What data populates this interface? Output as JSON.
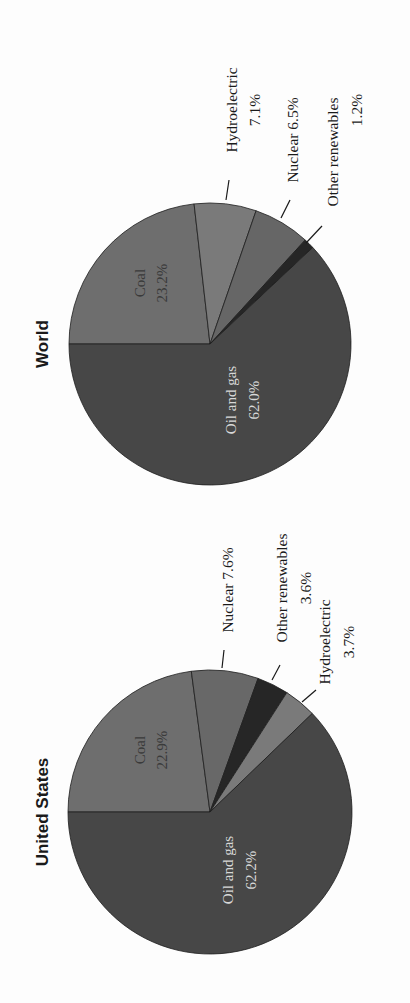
{
  "chart_data": [
    {
      "type": "pie",
      "title": "World",
      "orientation": "rotated 90° counterclockwise",
      "labels": [
        "Coal",
        "Hydroelectric",
        "Nuclear",
        "Other renewables",
        "Oil and gas"
      ],
      "values": [
        23.2,
        7.1,
        6.5,
        1.2,
        62.0
      ],
      "value_labels": [
        "23.2%",
        "7.1%",
        "6.5%",
        "1.2%",
        "62.0%"
      ],
      "colors": [
        "#6e6e6e",
        "#7a7a7a",
        "#666666",
        "#262626",
        "#474747"
      ]
    },
    {
      "type": "pie",
      "title": "United States",
      "orientation": "rotated 90° counterclockwise",
      "labels": [
        "Coal",
        "Nuclear",
        "Other renewables",
        "Hydroelectric",
        "Oil and gas"
      ],
      "values": [
        22.9,
        7.6,
        3.6,
        3.7,
        62.2
      ],
      "value_labels": [
        "22.9%",
        "7.6%",
        "3.6%",
        "3.7%",
        "62.2%"
      ],
      "colors": [
        "#6e6e6e",
        "#686868",
        "#262626",
        "#7a7a7a",
        "#474747"
      ]
    }
  ],
  "charts": {
    "world": {
      "title": "World",
      "inner": {
        "coal_name": "Coal",
        "coal_value": "23.2%",
        "oil_name": "Oil and gas",
        "oil_value": "62.0%"
      },
      "external": {
        "hydro_name": "Hydroelectric",
        "hydro_value": "7.1%",
        "nuclear": "Nuclear 6.5%",
        "other_name": "Other renewables",
        "other_value": "1.2%"
      }
    },
    "us": {
      "title": "United States",
      "inner": {
        "coal_name": "Coal",
        "coal_value": "22.9%",
        "oil_name": "Oil and gas",
        "oil_value": "62.2%"
      },
      "external": {
        "nuclear": "Nuclear 7.6%",
        "other_name": "Other renewables",
        "other_value": "3.6%",
        "hydro_name": "Hydroelectric",
        "hydro_value": "3.7%"
      }
    }
  }
}
